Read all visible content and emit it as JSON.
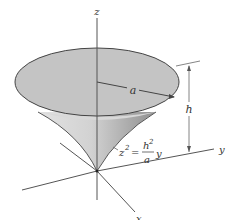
{
  "figure": {
    "type": "3D solid of revolution diagram",
    "axes": {
      "x_label": "x",
      "y_label": "y",
      "z_label": "z"
    },
    "dimensions": {
      "radius_label": "a",
      "height_label": "h"
    },
    "equation": {
      "lhs": "z",
      "lhs_exp": "2",
      "equals": "=",
      "numerator": "h",
      "numerator_exp": "2",
      "denominator": "a",
      "variable": "y"
    },
    "colors": {
      "disk_fill": "#c4c4c4",
      "surface_light": "#dcdcdc",
      "surface_dark": "#9e9e9e",
      "line": "#444444",
      "axis": "#555555",
      "background": "#ffffff"
    }
  }
}
